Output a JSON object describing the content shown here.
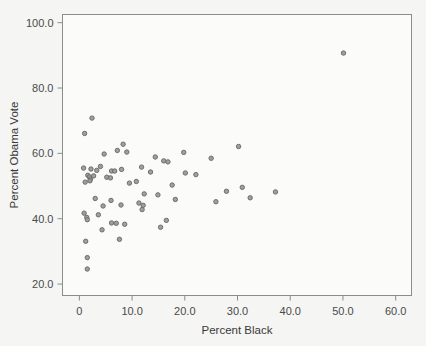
{
  "chart_data": {
    "type": "scatter",
    "title": "",
    "xlabel": "Percent Black",
    "ylabel": "Percent Obama Vote",
    "xlim": [
      -3.2,
      63.0
    ],
    "ylim": [
      16.5,
      102.5
    ],
    "grid": false,
    "legend": null,
    "xticks": [
      0,
      10,
      20,
      30,
      40,
      50,
      60
    ],
    "xticklabels": [
      "0",
      "10.0",
      "20.0",
      "30.0",
      "40.0",
      "50.0",
      "60.0"
    ],
    "yticks": [
      20,
      40,
      60,
      80,
      100
    ],
    "yticklabels": [
      "20.0",
      "40.0",
      "60.0",
      "80.0",
      "100.0"
    ],
    "marker": {
      "shape": "circle",
      "size_px": 4.4,
      "fill": "#9a9a9a",
      "edge": "#6e6e6e"
    },
    "points": [
      {
        "x": 50.1,
        "y": 90.7
      },
      {
        "x": 2.4,
        "y": 70.8
      },
      {
        "x": 1.0,
        "y": 66.1
      },
      {
        "x": 8.3,
        "y": 62.8
      },
      {
        "x": 30.2,
        "y": 62.1
      },
      {
        "x": 7.2,
        "y": 60.9
      },
      {
        "x": 9.0,
        "y": 60.4
      },
      {
        "x": 19.8,
        "y": 60.3
      },
      {
        "x": 4.7,
        "y": 59.8
      },
      {
        "x": 14.4,
        "y": 58.9
      },
      {
        "x": 25.0,
        "y": 58.5
      },
      {
        "x": 16.0,
        "y": 57.7
      },
      {
        "x": 16.8,
        "y": 57.4
      },
      {
        "x": 4.0,
        "y": 56.0
      },
      {
        "x": 11.8,
        "y": 55.8
      },
      {
        "x": 0.8,
        "y": 55.5
      },
      {
        "x": 2.2,
        "y": 55.2
      },
      {
        "x": 8.0,
        "y": 55.1
      },
      {
        "x": 3.3,
        "y": 54.8
      },
      {
        "x": 6.1,
        "y": 54.6
      },
      {
        "x": 6.7,
        "y": 54.6
      },
      {
        "x": 13.5,
        "y": 54.3
      },
      {
        "x": 20.1,
        "y": 54.0
      },
      {
        "x": 22.1,
        "y": 53.5
      },
      {
        "x": 1.6,
        "y": 53.3
      },
      {
        "x": 2.7,
        "y": 53.1
      },
      {
        "x": 1.9,
        "y": 52.8
      },
      {
        "x": 5.2,
        "y": 52.7
      },
      {
        "x": 5.9,
        "y": 52.5
      },
      {
        "x": 2.1,
        "y": 52.1
      },
      {
        "x": 2.0,
        "y": 51.6
      },
      {
        "x": 10.8,
        "y": 51.4
      },
      {
        "x": 1.1,
        "y": 51.2
      },
      {
        "x": 9.5,
        "y": 50.9
      },
      {
        "x": 17.6,
        "y": 50.3
      },
      {
        "x": 30.9,
        "y": 49.6
      },
      {
        "x": 27.9,
        "y": 48.4
      },
      {
        "x": 37.2,
        "y": 48.2
      },
      {
        "x": 12.3,
        "y": 47.6
      },
      {
        "x": 14.9,
        "y": 47.3
      },
      {
        "x": 32.4,
        "y": 46.4
      },
      {
        "x": 3.0,
        "y": 46.2
      },
      {
        "x": 18.2,
        "y": 45.9
      },
      {
        "x": 6.0,
        "y": 45.6
      },
      {
        "x": 25.9,
        "y": 45.2
      },
      {
        "x": 11.3,
        "y": 44.8
      },
      {
        "x": 7.9,
        "y": 44.2
      },
      {
        "x": 12.1,
        "y": 44.1
      },
      {
        "x": 4.5,
        "y": 43.9
      },
      {
        "x": 11.9,
        "y": 42.8
      },
      {
        "x": 0.9,
        "y": 41.7
      },
      {
        "x": 3.6,
        "y": 41.2
      },
      {
        "x": 1.4,
        "y": 40.4
      },
      {
        "x": 1.5,
        "y": 39.7
      },
      {
        "x": 16.5,
        "y": 39.5
      },
      {
        "x": 6.1,
        "y": 38.7
      },
      {
        "x": 7.0,
        "y": 38.6
      },
      {
        "x": 8.6,
        "y": 38.3
      },
      {
        "x": 15.4,
        "y": 37.4
      },
      {
        "x": 4.3,
        "y": 36.6
      },
      {
        "x": 7.6,
        "y": 33.7
      },
      {
        "x": 1.2,
        "y": 33.1
      },
      {
        "x": 1.5,
        "y": 28.1
      },
      {
        "x": 1.5,
        "y": 24.6
      }
    ]
  },
  "axes": {
    "x_tick_labels": [
      "0",
      "10.0",
      "20.0",
      "30.0",
      "40.0",
      "50.0",
      "60.0"
    ],
    "y_tick_labels": [
      "20.0",
      "40.0",
      "60.0",
      "80.0",
      "100.0"
    ],
    "x_axis_title": "Percent Black",
    "y_axis_title": "Percent Obama Vote"
  }
}
